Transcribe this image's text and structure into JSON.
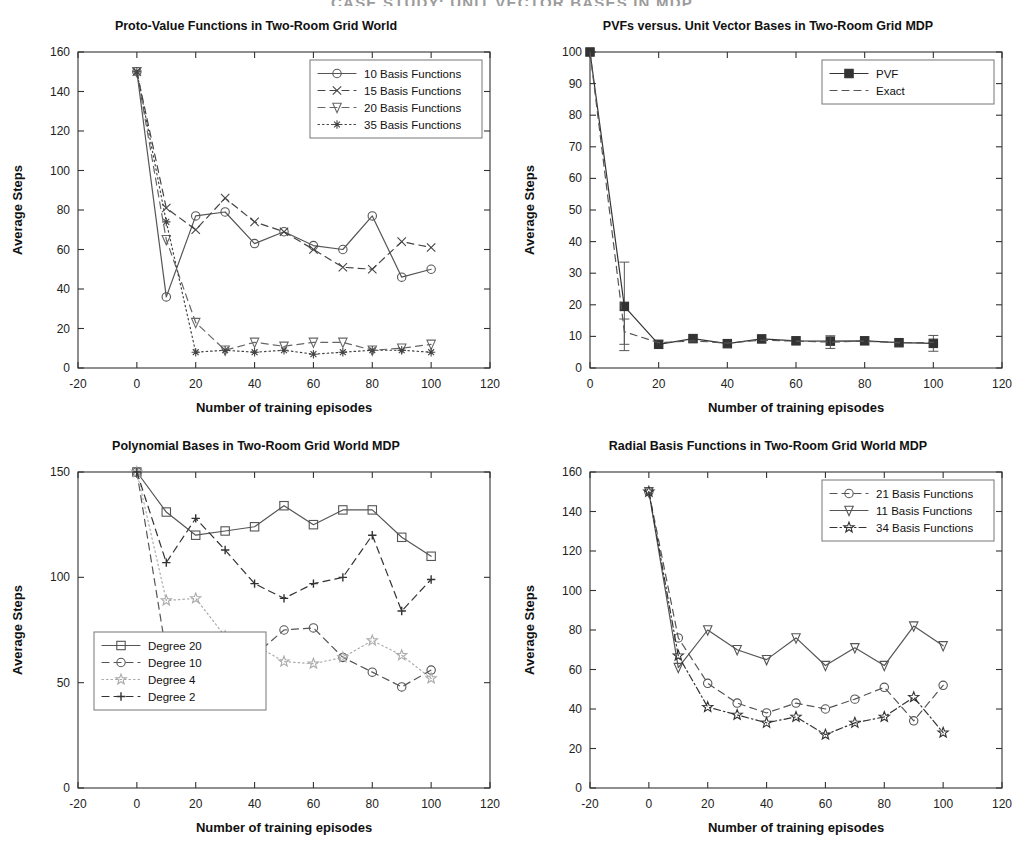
{
  "header": {
    "running_head": "CASE STUDY: UNIT VECTOR BASES IN MDP"
  },
  "common": {
    "xlabel": "Number of training episodes",
    "ylabel": "Average Steps"
  },
  "chart_data": [
    {
      "id": "proto-value-functions",
      "type": "line",
      "title": "Proto-Value Functions in Two-Room Grid World",
      "xlabel": "Number of training episodes",
      "ylabel": "Average Steps",
      "xlim": [
        -20,
        120
      ],
      "ylim": [
        0,
        160
      ],
      "xticks": [
        -20,
        0,
        20,
        40,
        60,
        80,
        100,
        120
      ],
      "yticks": [
        0,
        20,
        40,
        60,
        80,
        100,
        120,
        140,
        160
      ],
      "grid": false,
      "legend_position": "top-right",
      "x": [
        0,
        10,
        20,
        30,
        40,
        50,
        60,
        70,
        80,
        90,
        100
      ],
      "series": [
        {
          "name": "10 Basis Functions",
          "marker": "circle",
          "dash": "solid",
          "color": "#555555",
          "values": [
            150,
            36,
            77,
            79,
            63,
            69,
            62,
            60,
            77,
            46,
            50
          ]
        },
        {
          "name": "15 Basis Functions",
          "marker": "cross",
          "dash": "dashed",
          "color": "#444444",
          "values": [
            150,
            81,
            70,
            86,
            74,
            69,
            60,
            51,
            50,
            64,
            61
          ]
        },
        {
          "name": "20 Basis Functions",
          "marker": "triangle-down",
          "dash": "dashed",
          "color": "#666666",
          "values": [
            150,
            65,
            23,
            9,
            13,
            11,
            13,
            13,
            9,
            10,
            12
          ]
        },
        {
          "name": "35 Basis Functions",
          "marker": "asterisk",
          "dash": "dotted",
          "color": "#444444",
          "values": [
            150,
            74,
            8,
            9,
            8,
            9,
            7,
            8,
            9,
            9,
            8
          ]
        }
      ]
    },
    {
      "id": "pvfs-versus-unit-vector",
      "type": "line",
      "title": "PVFs versus. Unit Vector Bases in Two-Room Grid MDP",
      "xlabel": "Number of training episodes",
      "ylabel": "Average Steps",
      "xlim": [
        0,
        120
      ],
      "ylim": [
        0,
        100
      ],
      "xticks": [
        0,
        20,
        40,
        60,
        80,
        100,
        120
      ],
      "yticks": [
        0,
        10,
        20,
        30,
        40,
        50,
        60,
        70,
        80,
        90,
        100
      ],
      "grid": false,
      "legend_position": "top-right",
      "x": [
        0,
        10,
        20,
        30,
        40,
        50,
        60,
        70,
        80,
        90,
        100
      ],
      "series": [
        {
          "name": "PVF",
          "marker": "square-filled",
          "dash": "solid",
          "color": "#333333",
          "values": [
            100,
            19.5,
            7.5,
            9.3,
            7.7,
            9.2,
            8.6,
            8.5,
            8.6,
            8.0,
            7.8
          ],
          "errors": [
            0,
            14,
            0,
            0,
            0,
            0,
            0,
            0,
            0,
            0,
            2.5
          ]
        },
        {
          "name": "Exact",
          "marker": "none",
          "dash": "dashed",
          "color": "#555555",
          "values": [
            100,
            11.5,
            8.0,
            8.6,
            7.9,
            8.8,
            8.5,
            8.2,
            8.5,
            8.0,
            8.1
          ],
          "errors": [
            0,
            4,
            0,
            0,
            0,
            0,
            0,
            2,
            0,
            0,
            0
          ]
        }
      ]
    },
    {
      "id": "polynomial-bases",
      "type": "line",
      "title": "Polynomial Bases in Two-Room Grid World MDP",
      "xlabel": "Number of training episodes",
      "ylabel": "Average Steps",
      "xlim": [
        -20,
        120
      ],
      "ylim": [
        0,
        150
      ],
      "xticks": [
        -20,
        0,
        20,
        40,
        60,
        80,
        100,
        120
      ],
      "yticks": [
        0,
        50,
        100,
        150
      ],
      "grid": false,
      "legend_position": "bottom-left",
      "x": [
        0,
        10,
        20,
        30,
        40,
        50,
        60,
        70,
        80,
        90,
        100
      ],
      "series": [
        {
          "name": "Degree 20",
          "marker": "square",
          "dash": "solid",
          "color": "#555555",
          "values": [
            150,
            131,
            120,
            122,
            124,
            134,
            125,
            132,
            132,
            119,
            110
          ]
        },
        {
          "name": "Degree 10",
          "marker": "circle",
          "dash": "dashed",
          "color": "#555555",
          "values": [
            150,
            64,
            66,
            53,
            63,
            75,
            76,
            62,
            55,
            48,
            56
          ]
        },
        {
          "name": "Degree 4",
          "marker": "star",
          "dash": "dotted",
          "color": "#aaaaaa",
          "values": [
            150,
            89,
            90,
            72,
            68,
            60,
            59,
            62,
            70,
            63,
            52
          ]
        },
        {
          "name": "Degree 2",
          "marker": "plus",
          "dash": "dashed",
          "color": "#333333",
          "values": [
            150,
            107,
            128,
            113,
            97,
            90,
            97,
            100,
            120,
            84,
            99
          ]
        }
      ]
    },
    {
      "id": "radial-basis-functions",
      "type": "line",
      "title": "Radial Basis Functions in Two-Room Grid World MDP",
      "xlabel": "Number of training episodes",
      "ylabel": "Average Steps",
      "xlim": [
        -20,
        120
      ],
      "ylim": [
        0,
        160
      ],
      "xticks": [
        -20,
        0,
        20,
        40,
        60,
        80,
        100,
        120
      ],
      "yticks": [
        0,
        20,
        40,
        60,
        80,
        100,
        120,
        140,
        160
      ],
      "grid": false,
      "legend_position": "top-right",
      "x": [
        0,
        10,
        20,
        30,
        40,
        50,
        60,
        70,
        80,
        90,
        100
      ],
      "series": [
        {
          "name": "21 Basis Functions",
          "marker": "circle",
          "dash": "dashed",
          "color": "#555555",
          "values": [
            150,
            76,
            53,
            43,
            38,
            43,
            40,
            45,
            51,
            34,
            52
          ]
        },
        {
          "name": "11 Basis Functions",
          "marker": "triangle-down",
          "dash": "solid",
          "color": "#555555",
          "values": [
            150,
            61,
            80,
            70,
            65,
            76,
            62,
            71,
            62,
            82,
            72
          ]
        },
        {
          "name": "34 Basis Functions",
          "marker": "star",
          "dash": "dashdot",
          "color": "#333333",
          "values": [
            150,
            67,
            41,
            37,
            33,
            36,
            27,
            33,
            36,
            46,
            28
          ]
        }
      ]
    }
  ]
}
